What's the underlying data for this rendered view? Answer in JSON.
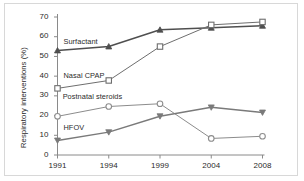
{
  "chart_data": {
    "type": "line",
    "title": "",
    "xlabel": "",
    "ylabel": "Respiratory interventions (%)",
    "x": [
      1991,
      1994,
      1999,
      2004,
      2008
    ],
    "xtick_labels": [
      "1991",
      "1994",
      "1999",
      "2004",
      "2008"
    ],
    "ytick_labels": [
      "0",
      "10",
      "20",
      "30",
      "40",
      "50",
      "60",
      "70"
    ],
    "ytick_values": [
      0,
      10,
      20,
      30,
      40,
      50,
      60,
      70
    ],
    "ylim": [
      0,
      70
    ],
    "grid": false,
    "legend_position": "inline-labels",
    "series": [
      {
        "name": "Surfactant",
        "marker": "triangle-up-filled",
        "color": "#4f4f4f",
        "values": [
          53.0,
          55.0,
          63.5,
          64.5,
          65.5
        ],
        "label_x": 1991.35,
        "label_y": 57.5
      },
      {
        "name": "Nasal CPAP",
        "marker": "square-open",
        "color": "#6e6e6e",
        "values": [
          33.8,
          37.8,
          55.0,
          66.0,
          67.5
        ],
        "label_x": 1991.35,
        "label_y": 40.0
      },
      {
        "name": "Postnatal steroids",
        "marker": "circle-open",
        "color": "#8c8c8c",
        "values": [
          19.6,
          24.6,
          26.0,
          8.4,
          9.5
        ],
        "label_x": 1991.3,
        "label_y": 29.5
      },
      {
        "name": "HFOV",
        "marker": "triangle-down-filled",
        "color": "#7a7a7a",
        "values": [
          7.4,
          11.6,
          19.7,
          24.2,
          21.6
        ],
        "label_x": 1991.35,
        "label_y": 13.5
      }
    ]
  },
  "figure": {
    "frame_color": "#d8d8d8",
    "background": "#ffffff",
    "axis_color": "#8a8a8a",
    "text_color": "#2b2b2b"
  }
}
